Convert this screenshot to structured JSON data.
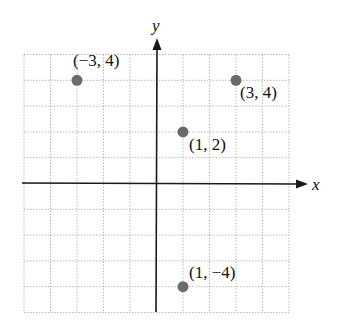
{
  "chart_data": {
    "type": "scatter",
    "title": "",
    "xlabel": "x",
    "ylabel": "y",
    "xlim": [
      -5,
      5
    ],
    "ylim": [
      -5,
      5
    ],
    "grid": true,
    "grid_style": "dotted",
    "points": [
      {
        "x": -3,
        "y": 4,
        "label": "(−3, 4)"
      },
      {
        "x": 3,
        "y": 4,
        "label": "(3, 4)"
      },
      {
        "x": 1,
        "y": 2,
        "label": "(1, 2)"
      },
      {
        "x": 1,
        "y": -4,
        "label": "(1, −4)"
      }
    ],
    "colors": {
      "point": "#6b6b6b",
      "axis": "#1a1a1a",
      "grid": "#b0b0b0"
    }
  }
}
